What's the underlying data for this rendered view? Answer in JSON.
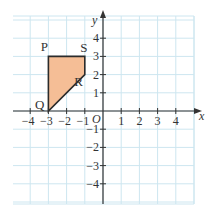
{
  "diagram": {
    "type": "coordinate-grid",
    "axes": {
      "x_label": "x",
      "y_label": "y",
      "origin_label": "O",
      "x_range": [
        -4,
        4
      ],
      "y_range": [
        -4,
        4
      ],
      "x_ticks": [
        {
          "value": -4,
          "label": "−4"
        },
        {
          "value": -3,
          "label": "−3"
        },
        {
          "value": -2,
          "label": "−2"
        },
        {
          "value": -1,
          "label": "−1"
        },
        {
          "value": 1,
          "label": "1"
        },
        {
          "value": 2,
          "label": "2"
        },
        {
          "value": 3,
          "label": "3"
        },
        {
          "value": 4,
          "label": "4"
        }
      ],
      "y_ticks": [
        {
          "value": 4,
          "label": "4"
        },
        {
          "value": 3,
          "label": "3"
        },
        {
          "value": 2,
          "label": "2"
        },
        {
          "value": 1,
          "label": "1"
        },
        {
          "value": -1,
          "label": "−1"
        },
        {
          "value": -2,
          "label": "−2"
        },
        {
          "value": -3,
          "label": "−3"
        },
        {
          "value": -4,
          "label": "−4"
        }
      ]
    },
    "shape": {
      "name": "PQRS",
      "fill_color": "#F5BE96",
      "stroke_color": "#2b2b2b",
      "vertices": [
        {
          "label": "P",
          "x": -3,
          "y": 3
        },
        {
          "label": "S",
          "x": -1,
          "y": 3
        },
        {
          "label": "R",
          "x": -1,
          "y": 2
        },
        {
          "label": "Q",
          "x": -3,
          "y": 0
        }
      ]
    },
    "colors": {
      "grid_line": "#CDE6F0",
      "axis": "#333333",
      "background": "#ffffff"
    }
  }
}
